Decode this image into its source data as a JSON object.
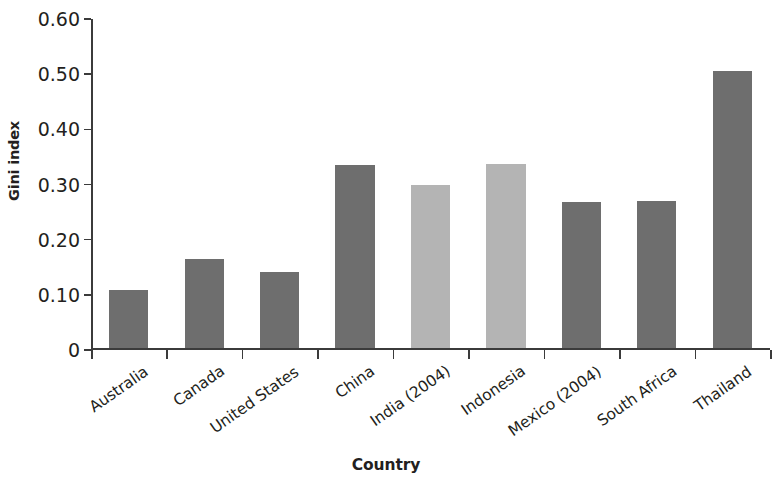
{
  "chart_data": {
    "type": "bar",
    "title": "",
    "xlabel": "Country",
    "ylabel": "Gini index",
    "categories": [
      "Australia",
      "Canada",
      "United States",
      "China",
      "India (2004)",
      "Indonesia",
      "Mexico (2004)",
      "South Africa",
      "Thailand"
    ],
    "values": [
      0.105,
      0.163,
      0.139,
      0.332,
      0.297,
      0.334,
      0.266,
      0.267,
      0.503
    ],
    "bar_colors": [
      "#6e6e6e",
      "#6e6e6e",
      "#6e6e6e",
      "#6e6e6e",
      "#b4b4b4",
      "#b4b4b4",
      "#6e6e6e",
      "#6e6e6e",
      "#6e6e6e"
    ],
    "ylim": [
      0,
      0.6
    ],
    "ytick_values": [
      0,
      0.1,
      0.2,
      0.3,
      0.4,
      0.5,
      0.6
    ],
    "ytick_labels": [
      "0",
      "0.10",
      "0.20",
      "0.30",
      "0.40",
      "0.50",
      "0.60"
    ],
    "grid": false,
    "legend": null,
    "legend_position": "none",
    "annotations": []
  },
  "colors": {
    "axis": "#3b3b3b",
    "text": "#231f20",
    "background": "#ffffff",
    "bar_dark": "#6e6e6e",
    "bar_light": "#b4b4b4"
  }
}
